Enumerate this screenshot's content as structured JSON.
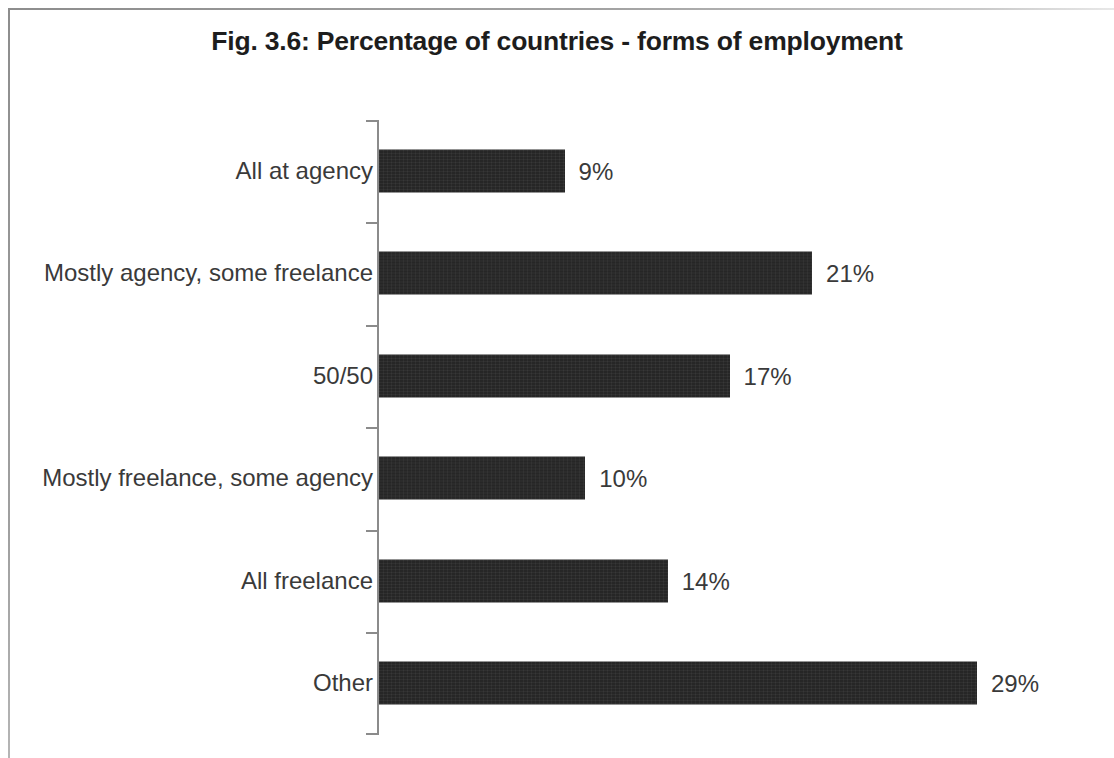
{
  "figure": {
    "title": "Fig. 3.6: Percentage of countries - forms of employment",
    "bar_color": "#262626",
    "label_color": "#3a3a3a",
    "axis_color": "#8b8b8b",
    "background_color": "#ffffff"
  },
  "chart_data": {
    "type": "bar",
    "orientation": "horizontal",
    "title": "Fig. 3.6: Percentage of countries - forms of employment",
    "xlabel": "",
    "ylabel": "",
    "xlim": [
      0,
      29
    ],
    "grid": false,
    "legend": null,
    "value_suffix": "%",
    "categories": [
      "All at agency",
      "Mostly agency, some freelance",
      "50/50",
      "Mostly freelance, some agency",
      "All freelance",
      "Other"
    ],
    "values": [
      9,
      21,
      17,
      10,
      14,
      29
    ],
    "data_labels": [
      "9%",
      "21%",
      "17%",
      "10%",
      "14%",
      "29%"
    ]
  }
}
